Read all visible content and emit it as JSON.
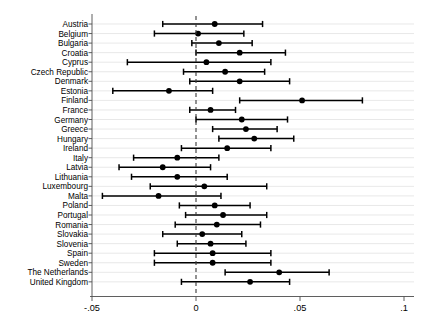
{
  "chart_data": {
    "type": "scatter",
    "subtype": "forest-plot",
    "title": "",
    "xlabel": "",
    "ylabel": "",
    "xlim": [
      -0.05,
      0.1
    ],
    "xticks": [
      -0.05,
      0,
      0.05,
      0.1
    ],
    "xticklabels": [
      "-.05",
      "0",
      ".05",
      ".1"
    ],
    "grid": true,
    "grid_orientation": "horizontal",
    "reference_line": 0,
    "reference_line_style": "dashed",
    "legend": "none",
    "categories": [
      "Austria",
      "Belgium",
      "Bulgaria",
      "Croatia",
      "Cyprus",
      "Czech Republic",
      "Denmark",
      "Estonia",
      "Finland",
      "France",
      "Germany",
      "Greece",
      "Hungary",
      "Ireland",
      "Italy",
      "Latvia",
      "Lithuania",
      "Luxembourg",
      "Malta",
      "Poland",
      "Portugal",
      "Romania",
      "Slovakia",
      "Slovenia",
      "Spain",
      "Sweden",
      "The Netherlands",
      "United Kingdom"
    ],
    "estimates": [
      0.009,
      0.001,
      0.011,
      0.021,
      0.005,
      0.014,
      0.021,
      -0.013,
      0.051,
      0.007,
      0.022,
      0.024,
      0.028,
      0.015,
      -0.009,
      -0.016,
      -0.009,
      0.004,
      -0.018,
      0.009,
      0.013,
      0.01,
      0.003,
      0.007,
      0.008,
      0.008,
      0.04,
      0.026
    ],
    "ci_low": [
      -0.016,
      -0.02,
      -0.002,
      0.0,
      -0.033,
      -0.006,
      -0.003,
      -0.04,
      0.021,
      -0.003,
      0.0,
      0.008,
      0.011,
      -0.007,
      -0.03,
      -0.037,
      -0.031,
      -0.022,
      -0.045,
      -0.008,
      -0.005,
      -0.01,
      -0.016,
      -0.009,
      -0.02,
      -0.02,
      0.014,
      -0.007
    ],
    "ci_high": [
      0.032,
      0.023,
      0.027,
      0.043,
      0.036,
      0.033,
      0.045,
      0.008,
      0.08,
      0.019,
      0.044,
      0.039,
      0.047,
      0.036,
      0.011,
      0.007,
      0.015,
      0.034,
      0.012,
      0.026,
      0.034,
      0.031,
      0.022,
      0.024,
      0.036,
      0.036,
      0.064,
      0.045
    ],
    "series": [
      {
        "name": "point estimate",
        "marker": "circle",
        "color": "#000000"
      },
      {
        "name": "confidence interval",
        "marker": "line-with-caps",
        "color": "#000000"
      }
    ]
  },
  "axis": {
    "tick_labels": [
      "-.05",
      "0",
      ".05",
      ".1"
    ]
  }
}
